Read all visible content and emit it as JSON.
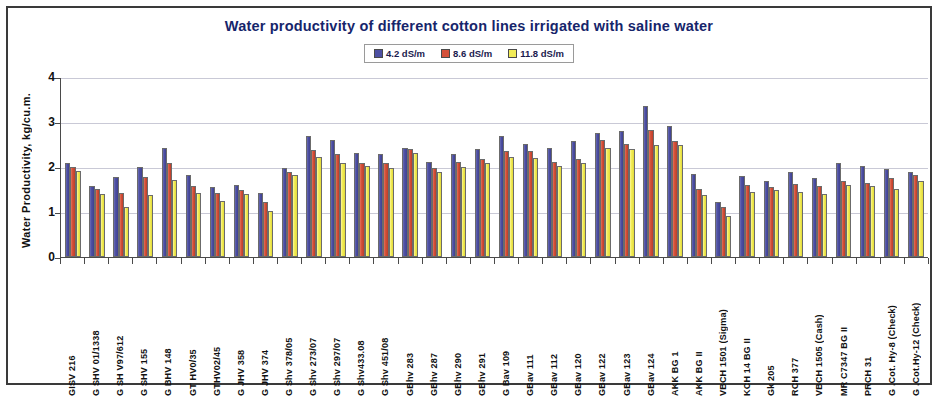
{
  "chart_data": {
    "type": "bar",
    "title": "Water productivity  of different cotton lines irrigated with saline water",
    "xlabel": "",
    "ylabel": "Water Productivity, kg/cu.m.",
    "ylim": [
      0,
      4
    ],
    "yticks": [
      "0",
      "1",
      "2",
      "3",
      "4"
    ],
    "grid": true,
    "legend_position": "top-center",
    "categories": [
      "GISV 216",
      "G SHV 01/1338",
      "G SH V97/612",
      "G SHV 155",
      "G BHV 148",
      "GT HV0/35",
      "GTHV02/45",
      "G JHV 358",
      "G JHV 374",
      "G Shv 378/05",
      "G Shv 273/07",
      "G Shv 297/07",
      "G Shv433.08",
      "G Shv 451/08",
      "GBhv 283",
      "GBhv 287",
      "GBhv 290",
      "GBhv 291",
      "G Bav 109",
      "GBav 111",
      "GBav 112",
      "GBav 120",
      "GBav 122",
      "GBav 123",
      "GBav 124",
      "AKK BG 1",
      "AKK BG II",
      "VBCH 1501 (Sigma)",
      "KCH 14 BG II",
      "Gk 205",
      "RCH 377",
      "VBCH 1505 (Cash)",
      "MR C7347 BG II",
      "PRCH 31",
      "G .Cot. Hy-8 (Check)",
      "G .Cot.Hy-12 (Check)"
    ],
    "series": [
      {
        "name": "4.2 dS/m",
        "color": "#4e50a3",
        "values": [
          2.08,
          1.58,
          1.78,
          2.0,
          2.42,
          1.82,
          1.55,
          1.6,
          1.42,
          1.98,
          2.7,
          2.6,
          2.32,
          2.3,
          2.42,
          2.12,
          2.28,
          2.4,
          2.7,
          2.52,
          2.42,
          2.58,
          2.75,
          2.8,
          3.35,
          2.92,
          1.85,
          1.22,
          1.8,
          1.68,
          1.88,
          1.75,
          2.1,
          2.02,
          1.95,
          1.9
        ]
      },
      {
        "name": "8.6 dS/m",
        "color": "#d4513a",
        "values": [
          2.0,
          1.52,
          1.42,
          1.78,
          2.1,
          1.58,
          1.42,
          1.5,
          1.22,
          1.88,
          2.38,
          2.28,
          2.08,
          2.08,
          2.4,
          1.98,
          2.12,
          2.18,
          2.35,
          2.35,
          2.12,
          2.18,
          2.6,
          2.52,
          2.82,
          2.58,
          1.52,
          1.12,
          1.6,
          1.55,
          1.62,
          1.58,
          1.68,
          1.65,
          1.75,
          1.82
        ]
      },
      {
        "name": "11.8 dS/m",
        "color": "#f2ec57",
        "values": [
          1.92,
          1.4,
          1.12,
          1.38,
          1.72,
          1.42,
          1.25,
          1.4,
          1.02,
          1.82,
          2.22,
          2.1,
          2.02,
          1.98,
          2.32,
          1.9,
          2.0,
          2.08,
          2.22,
          2.2,
          2.02,
          2.08,
          2.42,
          2.4,
          2.48,
          2.48,
          1.38,
          0.92,
          1.45,
          1.48,
          1.45,
          1.4,
          1.6,
          1.58,
          1.52,
          1.68
        ]
      }
    ]
  }
}
